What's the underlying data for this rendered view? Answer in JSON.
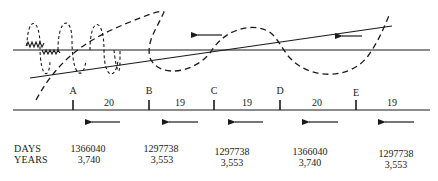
{
  "diagram": {
    "top": {
      "horizontal_line": {
        "x1": 13,
        "y1": 50,
        "x2": 430,
        "y2": 50
      },
      "slanted_line": {
        "x1": 30,
        "y1": 78,
        "x2": 392,
        "y2": 26
      },
      "top_arrows": [
        {
          "x1": 222,
          "x2": 196,
          "y": 35,
          "direction": "left"
        },
        {
          "x1": 360,
          "x2": 340,
          "y": 36,
          "direction": "left"
        }
      ]
    },
    "timeline": {
      "line": {
        "x1": 13,
        "y1": 110,
        "x2": 430,
        "y2": 110
      },
      "markers": [
        {
          "label": "A",
          "x": 73
        },
        {
          "label": "B",
          "x": 149
        },
        {
          "label": "C",
          "x": 214
        },
        {
          "label": "D",
          "x": 280
        },
        {
          "label": "E",
          "x": 356
        }
      ],
      "segments": [
        {
          "value": "20",
          "x": 109
        },
        {
          "value": "19",
          "x": 180
        },
        {
          "value": "19",
          "x": 247
        },
        {
          "value": "20",
          "x": 317
        },
        {
          "value": "19",
          "x": 392
        }
      ],
      "arrows": [
        {
          "x1": 120,
          "x2": 90
        },
        {
          "x1": 198,
          "x2": 167
        },
        {
          "x1": 263,
          "x2": 233
        },
        {
          "x1": 338,
          "x2": 307
        },
        {
          "x1": 414,
          "x2": 383
        }
      ]
    },
    "table": {
      "row_labels": {
        "days": "DAYS",
        "years": "YEARS"
      },
      "columns": [
        {
          "x": 88,
          "days": "1366040",
          "years": "3,740"
        },
        {
          "x": 161,
          "days": "1297738",
          "years": "3,553"
        },
        {
          "x": 232,
          "days": "1297738",
          "years": "3,553"
        },
        {
          "x": 310,
          "days": "1366040",
          "years": "3,740"
        },
        {
          "x": 385,
          "days": "1297738",
          "years": "3,553"
        }
      ]
    }
  }
}
